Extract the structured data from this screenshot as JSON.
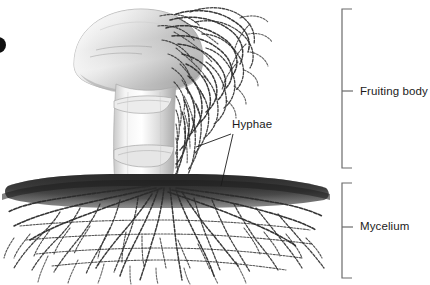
{
  "figure": {
    "background_color": "#ffffff",
    "width": 430,
    "height": 285,
    "line_color": "#4a4a4a",
    "text_color": "#1b1b1b",
    "soil_color": "#3b3b3b",
    "cap_color": "#d8d8d8",
    "stalk_color": "#e4e4e4"
  },
  "labels": {
    "fruiting_body": "Fruiting body",
    "mycelium": "Mycelium",
    "hyphae": "Hyphae"
  },
  "brackets": [
    {
      "name": "fruiting-body-bracket",
      "label": "Fruiting body",
      "top": 9,
      "bottom": 168,
      "x": 341
    },
    {
      "name": "mycelium-bracket",
      "label": "Mycelium",
      "top": 183,
      "bottom": 278,
      "x": 341
    }
  ],
  "parts": [
    {
      "name": "cap",
      "label": "cap"
    },
    {
      "name": "stalk",
      "label": "stalk"
    },
    {
      "name": "annulus",
      "label": "annulus"
    },
    {
      "name": "soil-line",
      "label": "soil surface"
    },
    {
      "name": "hyphae-network",
      "label": "hyphae"
    },
    {
      "name": "mycelium-network",
      "label": "mycelium"
    }
  ],
  "icons": {
    "corner_marker": "dot-marker"
  }
}
